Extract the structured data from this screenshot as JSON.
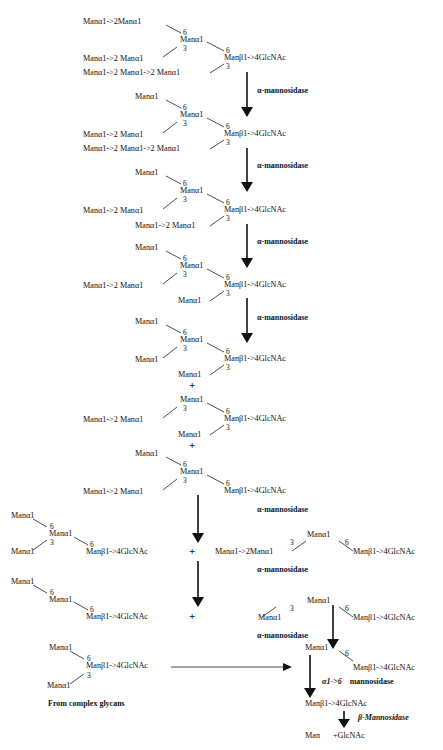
{
  "diagram": {
    "title": "",
    "enzymes": {
      "alpha_mannosidase": "α-mannosidase",
      "alpha16_prefix": "α1->6",
      "alpha16_suffix": "mannosidase",
      "beta_mannosidase": "β-Mannosidase"
    },
    "residues": {
      "man_a1": "Manα1",
      "man_a1_2man_a1": "Manα1->2Manα1",
      "man_a1_2_man_a1": "Manα1->2 Manα1",
      "man_a1_2_man_a1_2_man_a1": "Manα1->2 Manα1->2 Manα1",
      "core": "Manβ1->4GlcNAc",
      "man": "Man",
      "glcnac": "+GlcNAc"
    },
    "linkages": {
      "six": "6",
      "three": "3"
    },
    "plus": "+",
    "source_label": "From complex glycans"
  }
}
